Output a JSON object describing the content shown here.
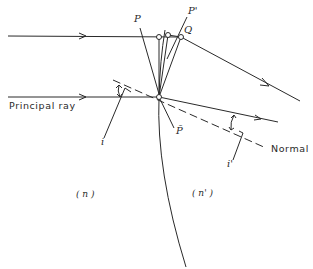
{
  "diagram": {
    "labels": {
      "P": "P",
      "P_prime": "P'",
      "Q": "Q",
      "P_bar": "P̄",
      "principal_ray": "Principal ray",
      "normal": "Normal",
      "i": "i",
      "i_prime": "i'",
      "n": "( n )",
      "n_prime": "( n' )"
    },
    "colors": {
      "line": "#2a2a2a",
      "background": "#ffffff"
    }
  }
}
